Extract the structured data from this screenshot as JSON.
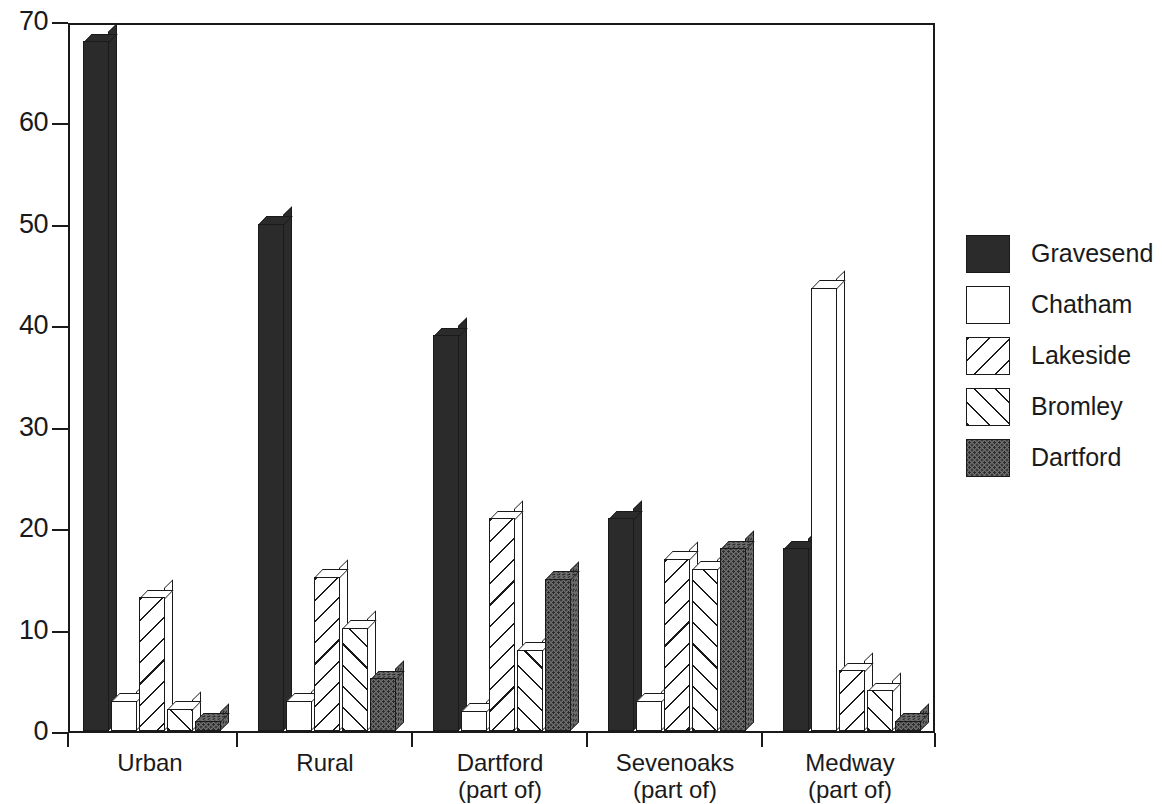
{
  "chart_data": {
    "type": "bar",
    "title": "",
    "subtitle": "",
    "xlabel": "",
    "ylabel": "",
    "ylim": [
      0,
      70
    ],
    "yticks": [
      0,
      10,
      20,
      30,
      40,
      50,
      60,
      70
    ],
    "ytick_labels": [
      "0",
      "10",
      "20",
      "30",
      "40",
      "50",
      "60",
      "70"
    ],
    "grid": false,
    "legend_position": "right",
    "categories": [
      "Urban",
      "Rural",
      "Dartford (part of)",
      "Sevenoaks (part of)",
      "Medway (part of)"
    ],
    "category_lines": [
      [
        "Urban",
        ""
      ],
      [
        "Rural",
        ""
      ],
      [
        "Dartford",
        "(part of)"
      ],
      [
        "Sevenoaks",
        "(part of)"
      ],
      [
        "Medway",
        "(part of)"
      ]
    ],
    "series": [
      {
        "name": "Gravesend",
        "fill": "solid",
        "color": "#2b2b2b",
        "values": [
          68.0,
          50.0,
          39.0,
          21.0,
          18.0
        ]
      },
      {
        "name": "Chatham",
        "fill": "white",
        "color": "#ffffff",
        "values": [
          3.0,
          3.0,
          2.0,
          3.0,
          43.7
        ]
      },
      {
        "name": "Lakeside",
        "fill": "hatch-b",
        "color": "#ffffff",
        "values": [
          13.2,
          15.2,
          21.0,
          17.0,
          6.0
        ]
      },
      {
        "name": "Bromley",
        "fill": "hatch-f",
        "color": "#ffffff",
        "values": [
          2.2,
          10.2,
          8.0,
          16.0,
          4.0
        ]
      },
      {
        "name": "Dartford",
        "fill": "dots",
        "color": "#6e6e6e",
        "values": [
          1.0,
          5.2,
          15.0,
          18.0,
          1.0
        ]
      }
    ]
  },
  "legend": {
    "items": [
      {
        "label": "Gravesend",
        "fill": "solid"
      },
      {
        "label": "Chatham",
        "fill": "white"
      },
      {
        "label": "Lakeside",
        "fill": "hatch-b"
      },
      {
        "label": "Bromley",
        "fill": "hatch-f"
      },
      {
        "label": "Dartford",
        "fill": "dots"
      }
    ]
  },
  "colors": {
    "axis": "#1a1a1a",
    "background": "#ffffff",
    "solid": "#2b2b2b",
    "dots": "#6e6e6e"
  }
}
